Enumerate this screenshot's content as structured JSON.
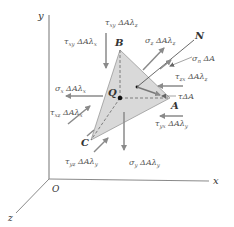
{
  "axes": {
    "x": "x",
    "y": "y",
    "z": "z",
    "origin": "O"
  },
  "points": {
    "A": "A",
    "B": "B",
    "C": "C",
    "Q": "Q",
    "N": "N"
  },
  "forces": {
    "tau_xy": "τ",
    "tau_xy_sub": "xy",
    "tau_xy_rest": " ΔAλ",
    "tau_xy_lam": "z",
    "sigma_z": "σ",
    "sigma_z_sub": "z",
    "sigma_z_rest": " ΔAλ",
    "sigma_z_lam": "z",
    "sigma_n": "σ",
    "sigma_n_sub": "n",
    "sigma_n_rest": " ΔA",
    "tau_zx": "τ",
    "tau_zx_sub": "zx",
    "tau_zx_rest": " ΔAλ",
    "tau_zx_lam": "z",
    "tau_total": "τΔA",
    "sigma_x": "σ",
    "sigma_x_sub": "x",
    "sigma_x_rest": " ΔAλ",
    "sigma_x_lam": "x",
    "tau_xz": "τ",
    "tau_xz_sub": "xz",
    "tau_xz_rest": " ΔAλ",
    "tau_xz_lam": "x",
    "tau_yx": "τ",
    "tau_yx_sub": "yx",
    "tau_yx_rest": " ΔAλ",
    "tau_yx_lam": "y",
    "tau_yz": "τ",
    "tau_yz_sub": "yz",
    "tau_yz_rest": " ΔAλ",
    "tau_yz_lam": "y",
    "sigma_y": "σ",
    "sigma_y_sub": "y",
    "sigma_y_rest": " ΔAλ",
    "sigma_y_lam": "y"
  },
  "colors": {
    "arrow": "#8a8a8a",
    "face": "#d9d9d9",
    "axis": "#8a8a8a"
  }
}
